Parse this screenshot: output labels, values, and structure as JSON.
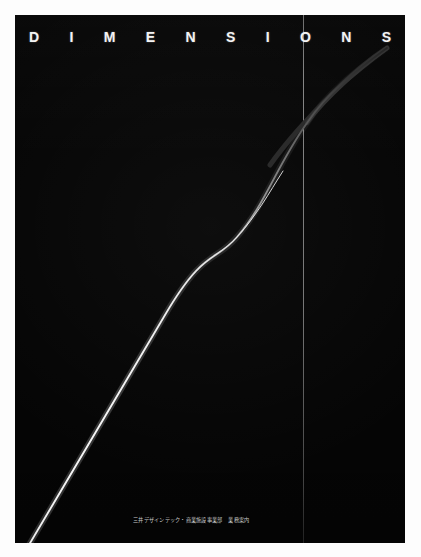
{
  "poster": {
    "background_color": "#fdfdfd",
    "panel_color": "#050505",
    "accent_color": "#f4f4f4",
    "panel": {
      "x": 15,
      "y": 15,
      "width": 390,
      "height": 528
    }
  },
  "headline": {
    "full_text": "DIMENSIONS",
    "letters": [
      "D",
      "I",
      "M",
      "E",
      "N",
      "S",
      "I",
      "O",
      "N",
      "S"
    ],
    "color": "#f4f4f4",
    "y": 30
  },
  "vertical_rule": {
    "x": 288,
    "color": "#b0b0b0",
    "width": 1
  },
  "curve": {
    "description": "sigmoid-s-curve",
    "color_bright": "#e8e8e8",
    "color_dim": "#2a2a2a",
    "path": "M 8 540 L 150 300 C 190 232 200 248 222 222 C 250 190 262 150 292 108 C 312 78 338 58 372 33",
    "start_point": [
      8,
      540
    ],
    "inflection_point": [
      210,
      240
    ],
    "end_point": [
      372,
      33
    ]
  },
  "caption": {
    "company": "三井デザインテック・商業施設事業部",
    "subtitle": "業務案内",
    "color": "#c9c9c9",
    "x": 133,
    "y": 503
  }
}
